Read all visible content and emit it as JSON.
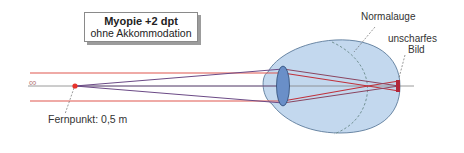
{
  "title_box": {
    "title": "Myopie +2 dpt",
    "subtitle": "ohne Akkommodation"
  },
  "labels": {
    "infinity": "∞",
    "far_point": "Fernpunkt: 0,5 m",
    "normal_eye": "Normalauge",
    "blurred_image_line1": "unscharfes",
    "blurred_image_line2": "Bild"
  },
  "colors": {
    "parallel_ray": "#e0574f",
    "far_point_ray": "#6b4a86",
    "converging_ray": "#b8323a",
    "eye_fill": "#c3d8ee",
    "eye_stroke": "#4d6d8f",
    "lens_fill": "#6a8fc8",
    "axis": "#808080",
    "far_point_dot": "#e8322a",
    "normal_eye_curve": "#6a8a8a"
  }
}
